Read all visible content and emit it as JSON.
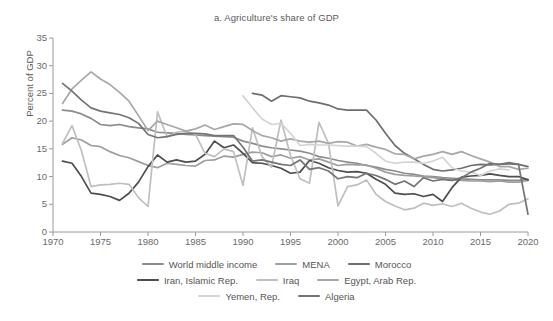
{
  "chart_data": {
    "type": "line",
    "title": "a. Agriculture's share of GDP",
    "xlabel": "",
    "ylabel": "Percent of GDP",
    "xlim": [
      1970,
      2020
    ],
    "ylim": [
      0,
      35
    ],
    "xticks": [
      1970,
      1975,
      1980,
      1985,
      1990,
      1995,
      2000,
      2005,
      2010,
      2015,
      2020
    ],
    "yticks": [
      0,
      5,
      10,
      15,
      20,
      25,
      30,
      35
    ],
    "grid": false,
    "legend_position": "bottom",
    "series": [
      {
        "name": "World middle income",
        "color": "#8c8c8c",
        "x": [
          1971,
          1972,
          1973,
          1974,
          1975,
          1976,
          1977,
          1978,
          1979,
          1980,
          1981,
          1982,
          1983,
          1984,
          1985,
          1986,
          1987,
          1988,
          1989,
          1990,
          1991,
          1992,
          1993,
          1994,
          1995,
          1996,
          1997,
          1998,
          1999,
          2000,
          2001,
          2002,
          2003,
          2004,
          2005,
          2006,
          2007,
          2008,
          2009,
          2010,
          2011,
          2012,
          2013,
          2014,
          2015,
          2016,
          2017,
          2018,
          2019,
          2020
        ],
        "values": [
          22.0,
          21.8,
          21.3,
          20.5,
          19.4,
          19.2,
          19.4,
          19.0,
          18.8,
          18.6,
          18.0,
          17.9,
          17.8,
          17.6,
          17.5,
          17.4,
          17.3,
          17.2,
          17.1,
          16.4,
          16.0,
          15.5,
          15.2,
          15.0,
          14.8,
          14.6,
          14.2,
          13.6,
          13.3,
          12.9,
          12.6,
          12.4,
          12.0,
          11.7,
          11.3,
          11.0,
          10.6,
          10.4,
          10.1,
          10.0,
          9.8,
          9.7,
          9.6,
          9.5,
          9.4,
          9.4,
          9.4,
          9.3,
          9.3,
          9.5
        ]
      },
      {
        "name": "MENA",
        "color": "#9e9e9e",
        "x": [
          1971,
          1972,
          1973,
          1974,
          1975,
          1976,
          1977,
          1978,
          1979,
          1980,
          1981,
          1982,
          1983,
          1984,
          1985,
          1986,
          1987,
          1988,
          1989,
          1990,
          1991,
          1992,
          1993,
          1994,
          1995,
          1996,
          1997,
          1998,
          1999,
          2000,
          2001,
          2002,
          2003,
          2004,
          2005,
          2006,
          2007,
          2008,
          2009,
          2010,
          2011,
          2012,
          2013,
          2014,
          2015,
          2016,
          2017,
          2018,
          2019,
          2020
        ],
        "values": [
          15.8,
          17.0,
          16.6,
          15.6,
          15.4,
          14.5,
          13.8,
          13.4,
          12.7,
          12.0,
          11.6,
          12.4,
          12.2,
          12.0,
          11.9,
          12.9,
          13.0,
          13.7,
          13.5,
          14.0,
          14.4,
          14.3,
          13.6,
          13.9,
          13.3,
          13.6,
          13.0,
          13.2,
          12.6,
          12.0,
          12.2,
          12.1,
          12.1,
          11.5,
          10.8,
          10.4,
          10.2,
          10.1,
          10.0,
          9.8,
          9.6,
          9.4,
          9.3,
          9.2,
          9.2,
          9.1,
          9.2,
          9.0,
          9.0,
          9.3
        ]
      },
      {
        "name": "Morocco",
        "color": "#6e6e6e",
        "x": [
          1991,
          1992,
          1993,
          1994,
          1995,
          1996,
          1997,
          1998,
          1999,
          2000,
          2001,
          2002,
          2003,
          2004,
          2005,
          2006,
          2007,
          2008,
          2009,
          2010,
          2011,
          2012,
          2013,
          2014,
          2015,
          2016,
          2017,
          2018,
          2019,
          2020
        ],
        "values": [
          25.0,
          24.7,
          23.6,
          24.6,
          24.4,
          24.2,
          23.6,
          23.3,
          22.9,
          22.2,
          22.0,
          22.0,
          22.0,
          20.2,
          17.8,
          15.6,
          14.2,
          13.2,
          12.2,
          11.3,
          11.0,
          11.2,
          11.5,
          12.0,
          12.2,
          12.1,
          12.2,
          12.3,
          12.2,
          11.8
        ]
      },
      {
        "name": "Iran, Islamic Rep.",
        "color": "#4d4d4d",
        "x": [
          1971,
          1972,
          1973,
          1974,
          1975,
          1976,
          1977,
          1978,
          1979,
          1980,
          1981,
          1982,
          1983,
          1984,
          1985,
          1986,
          1987,
          1988,
          1989,
          1990,
          1991,
          1992,
          1993,
          1994,
          1995,
          1996,
          1997,
          1998,
          1999,
          2000,
          2001,
          2002,
          2003,
          2004,
          2005,
          2006,
          2007,
          2008,
          2009,
          2010,
          2011,
          2012,
          2013,
          2014,
          2015,
          2016,
          2017,
          2018,
          2019,
          2020
        ],
        "values": [
          12.8,
          12.4,
          10.0,
          7.0,
          6.8,
          6.4,
          5.7,
          7.0,
          9.0,
          11.8,
          13.9,
          12.6,
          13.0,
          12.6,
          12.8,
          14.0,
          16.4,
          15.2,
          15.7,
          14.2,
          12.5,
          12.4,
          12.0,
          11.5,
          10.6,
          10.8,
          12.9,
          12.4,
          11.6,
          11.1,
          10.8,
          10.9,
          10.6,
          9.5,
          8.6,
          7.0,
          6.8,
          6.9,
          6.4,
          6.8,
          5.5,
          8.0,
          9.9,
          10.1,
          10.2,
          10.5,
          10.2,
          10.0,
          10.0,
          9.4
        ]
      },
      {
        "name": "Iraq",
        "color": "#bfbfbf",
        "x": [
          1971,
          1972,
          1973,
          1974,
          1975,
          1976,
          1977,
          1978,
          1979,
          1980,
          1981,
          1982,
          1983,
          1984,
          1985,
          1986,
          1987,
          1988,
          1989,
          1990,
          1991,
          1992,
          1993,
          1994,
          1995,
          1996,
          1997,
          1998,
          1999,
          2000,
          2001,
          2002,
          2003,
          2004,
          2005,
          2006,
          2007,
          2008,
          2009,
          2010,
          2011,
          2012,
          2013,
          2014,
          2015,
          2016,
          2017,
          2018,
          2019,
          2020
        ],
        "values": [
          16.0,
          19.2,
          14.6,
          8.2,
          8.5,
          8.6,
          8.8,
          8.6,
          6.2,
          4.6,
          21.7,
          17.2,
          18.0,
          18.2,
          17.6,
          14.2,
          13.6,
          15.0,
          14.5,
          8.4,
          18.8,
          13.6,
          11.7,
          20.2,
          13.8,
          9.6,
          8.8,
          19.8,
          16.0,
          4.7,
          8.2,
          8.5,
          9.4,
          6.8,
          5.5,
          4.7,
          4.0,
          4.3,
          5.2,
          4.8,
          5.1,
          4.6,
          5.2,
          4.3,
          3.6,
          3.2,
          3.8,
          5.0,
          5.2,
          6.0
        ]
      },
      {
        "name": "Egypt, Arab Rep.",
        "color": "#a8a8a8",
        "x": [
          1971,
          1972,
          1973,
          1974,
          1975,
          1976,
          1977,
          1978,
          1979,
          1980,
          1981,
          1982,
          1983,
          1984,
          1985,
          1986,
          1987,
          1988,
          1989,
          1990,
          1991,
          1992,
          1993,
          1994,
          1995,
          1996,
          1997,
          1998,
          1999,
          2000,
          2001,
          2002,
          2003,
          2004,
          2005,
          2006,
          2007,
          2008,
          2009,
          2010,
          2011,
          2012,
          2013,
          2014,
          2015,
          2016,
          2017,
          2018,
          2019,
          2020
        ],
        "values": [
          23.2,
          25.8,
          27.4,
          28.9,
          27.6,
          26.6,
          25.2,
          23.6,
          21.0,
          18.3,
          20.0,
          19.4,
          18.8,
          18.2,
          18.6,
          19.3,
          18.5,
          19.0,
          19.5,
          19.4,
          18.3,
          17.4,
          17.0,
          16.4,
          16.8,
          16.4,
          16.2,
          16.4,
          16.0,
          16.3,
          16.2,
          15.5,
          15.8,
          15.3,
          14.9,
          14.1,
          14.0,
          13.2,
          13.7,
          14.0,
          14.5,
          14.0,
          14.5,
          13.8,
          13.2,
          12.6,
          11.8,
          11.8,
          11.3,
          11.5
        ]
      },
      {
        "name": "Yemen, Rep.",
        "color": "#d4d4d4",
        "x": [
          1990,
          1991,
          1992,
          1993,
          1994,
          1995,
          1996,
          1997,
          1998,
          1999,
          2000,
          2001,
          2002,
          2003,
          2004,
          2005,
          2006,
          2007,
          2008,
          2009,
          2010,
          2011,
          2012,
          2013,
          2014,
          2015,
          2016,
          2017,
          2018
        ],
        "values": [
          24.6,
          22.4,
          20.4,
          19.4,
          19.6,
          17.8,
          15.6,
          15.8,
          15.7,
          15.7,
          15.6,
          15.5,
          15.5,
          15.4,
          14.2,
          12.8,
          12.4,
          12.6,
          12.6,
          12.4,
          12.8,
          13.5,
          11.6,
          11.0,
          10.8,
          10.2,
          11.0,
          11.4,
          11.2
        ]
      },
      {
        "name": "Algeria",
        "color": "#747474",
        "x": [
          1971,
          1972,
          1973,
          1974,
          1975,
          1976,
          1977,
          1978,
          1979,
          1980,
          1981,
          1982,
          1983,
          1984,
          1985,
          1986,
          1987,
          1988,
          1989,
          1990,
          1991,
          1992,
          1993,
          1994,
          1995,
          1996,
          1997,
          1998,
          1999,
          2000,
          2001,
          2002,
          2003,
          2004,
          2005,
          2006,
          2007,
          2008,
          2009,
          2010,
          2011,
          2012,
          2013,
          2014,
          2015,
          2016,
          2017,
          2018,
          2019,
          2020
        ],
        "values": [
          26.8,
          25.4,
          23.8,
          22.4,
          21.8,
          21.5,
          21.2,
          20.6,
          19.6,
          17.6,
          17.0,
          17.2,
          17.6,
          17.8,
          17.8,
          17.7,
          17.4,
          17.4,
          17.4,
          15.3,
          12.8,
          13.0,
          12.6,
          12.2,
          12.0,
          13.0,
          11.3,
          11.6,
          11.0,
          9.6,
          10.0,
          9.8,
          10.6,
          10.2,
          9.5,
          8.6,
          9.2,
          8.2,
          9.8,
          9.2,
          9.5,
          9.3,
          9.8,
          10.8,
          11.5,
          12.4,
          12.2,
          12.5,
          12.2,
          3.2
        ]
      }
    ]
  },
  "legend": {
    "rows": [
      [
        {
          "label": "World middle income",
          "color": "#8c8c8c"
        },
        {
          "label": "MENA",
          "color": "#9e9e9e"
        },
        {
          "label": "Morocco",
          "color": "#6e6e6e"
        }
      ],
      [
        {
          "label": "Iran, Islamic Rep.",
          "color": "#4d4d4d"
        },
        {
          "label": "Iraq",
          "color": "#bfbfbf"
        },
        {
          "label": "Egypt, Arab Rep.",
          "color": "#a8a8a8"
        }
      ],
      [
        {
          "label": "Yemen, Rep.",
          "color": "#d4d4d4"
        },
        {
          "label": "Algeria",
          "color": "#747474"
        }
      ]
    ]
  },
  "axes": {
    "axis_color": "#9a9a9a",
    "tick_color": "#6a6a6a"
  }
}
